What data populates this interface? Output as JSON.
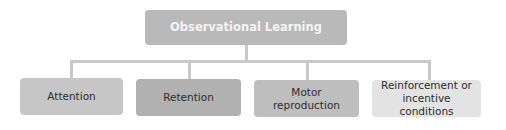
{
  "diagram": {
    "title": "Observational Learning",
    "children": [
      {
        "label": "Attention",
        "color": "#c6c6c6"
      },
      {
        "label": "Retention",
        "color": "#b1b1b1"
      },
      {
        "label": "Motor\nreproduction",
        "line1": "Motor",
        "line2": "reproduction",
        "color": "#bebebe"
      },
      {
        "label": "Reinforcement or\nincentive conditions",
        "line1": "Reinforcement or",
        "line2": "incentive conditions",
        "color": "#e3e3e3"
      }
    ],
    "root_color": "#b9b9b9",
    "connector_color": "#c9c9c9"
  }
}
